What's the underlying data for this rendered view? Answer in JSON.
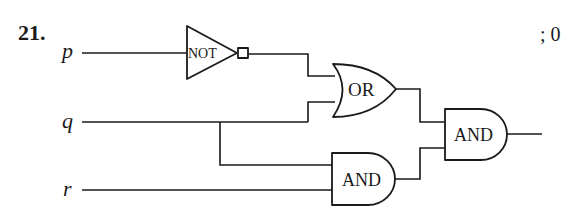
{
  "problem": {
    "number": "21.",
    "answer": "; 0"
  },
  "inputs": [
    {
      "name": "p",
      "label": "p"
    },
    {
      "name": "q",
      "label": "q"
    },
    {
      "name": "r",
      "label": "r"
    }
  ],
  "gates": {
    "not": {
      "label": "NOT",
      "inputs": [
        "p"
      ]
    },
    "or": {
      "label": "OR",
      "inputs": [
        "NOT p",
        "q"
      ]
    },
    "and_lower": {
      "label": "AND",
      "inputs": [
        "q",
        "r"
      ]
    },
    "and_final": {
      "label": "AND",
      "inputs": [
        "OR output",
        "lower AND output"
      ]
    }
  },
  "colors": {
    "line": "#1a1a1a",
    "background": "#ffffff"
  }
}
